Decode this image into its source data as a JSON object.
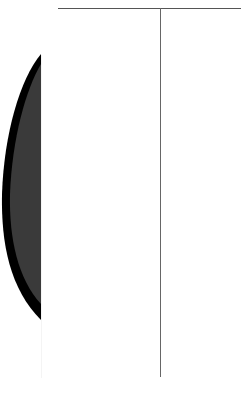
{
  "document": {
    "type": "scanned-page-fragment",
    "colors": {
      "background": "#ffffff",
      "rule": "#555555",
      "divider": "#666666",
      "shape_fill": "#3a3a3a",
      "shape_edge": "#000000"
    },
    "footer_text": ""
  }
}
